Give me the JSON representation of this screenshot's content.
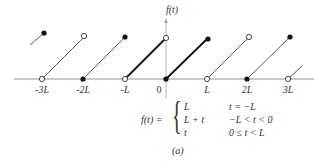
{
  "figure": {
    "y_axis_label": "f(t)",
    "x_tick_labels": [
      "-3L",
      "-2L",
      "-L",
      "0",
      "L",
      "2L",
      "3L"
    ],
    "caption": "(a)"
  },
  "formula": {
    "lhs": "f(t) =",
    "cases": [
      {
        "value": "L",
        "condition": "t = −L"
      },
      {
        "value": "L + t",
        "condition": "−L < t < 0"
      },
      {
        "value": "t",
        "condition": "0 ≤ t < L"
      }
    ]
  },
  "plot": {
    "description": "Periodic sawtooth with period 2L; ramps rise from 0 to L over intervals of length L; bold segments on (-L,0) and [0,L)",
    "segments": [
      {
        "from_t": "-4L",
        "to_t": "-3L",
        "start": "open-partial",
        "end": "filled",
        "bold": false
      },
      {
        "from_t": "-3L",
        "to_t": "-2L",
        "start": "open",
        "end": "open",
        "bold": false
      },
      {
        "from_t": "-2L",
        "to_t": "-L",
        "start": "filled",
        "end": "filled",
        "bold": false
      },
      {
        "from_t": "-L",
        "to_t": "0",
        "start": "open",
        "end": "open",
        "bold": true
      },
      {
        "from_t": "0",
        "to_t": "L",
        "start": "filled",
        "end": "filled",
        "bold": true
      },
      {
        "from_t": "L",
        "to_t": "2L",
        "start": "open",
        "end": "open",
        "bold": false
      },
      {
        "from_t": "2L",
        "to_t": "3L",
        "start": "filled",
        "end": "filled",
        "bold": false
      },
      {
        "from_t": "3L",
        "to_t": "4L",
        "start": "open",
        "end": "partial",
        "bold": false
      }
    ]
  }
}
